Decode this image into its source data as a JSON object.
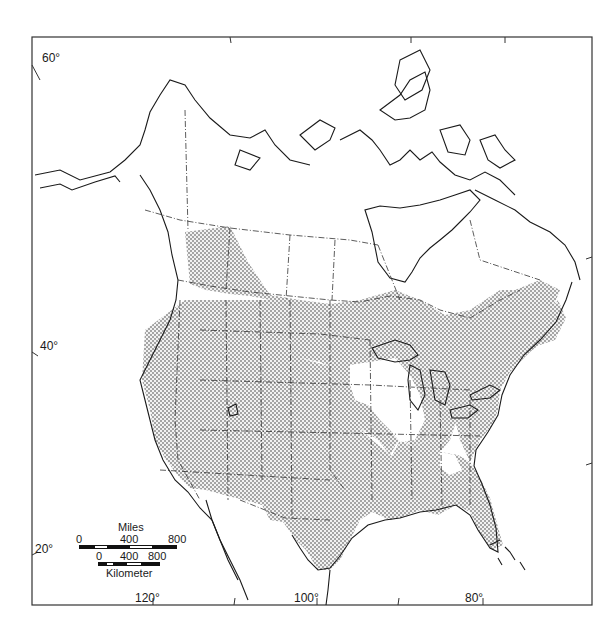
{
  "map": {
    "type": "distribution range map",
    "region": "North America",
    "colors": {
      "background": "#ffffff",
      "outline": "#1a1a1a",
      "range_fill_dot": "#555555",
      "range_fill_bg": "#e8e8e8"
    },
    "latitude_labels": [
      {
        "label": "60°",
        "x": 42,
        "y": 52
      },
      {
        "label": "40°",
        "x": 40,
        "y": 340
      },
      {
        "label": "20°",
        "x": 35,
        "y": 543
      }
    ],
    "longitude_labels": [
      {
        "label": "120°",
        "x": 135,
        "y": 592
      },
      {
        "label": "100°",
        "x": 294,
        "y": 592
      },
      {
        "label": "80°",
        "x": 465,
        "y": 592
      }
    ],
    "scale_bar": {
      "miles": {
        "title": "Miles",
        "ticks": [
          "0",
          "400",
          "800"
        ]
      },
      "kilometers": {
        "title": "Kilometer",
        "ticks": [
          "0",
          "400",
          "800"
        ]
      }
    },
    "shaded_range_description": "Shaded (stippled) range covers most of the contiguous United States, southern Canadian prairies and southern Ontario/Quebec, and the Maritimes; unshaded areas in the upper Midwest (Minnesota/Wisconsin/Iowa/Illinois region) and northern Canada, Alaska, and Mexico."
  }
}
